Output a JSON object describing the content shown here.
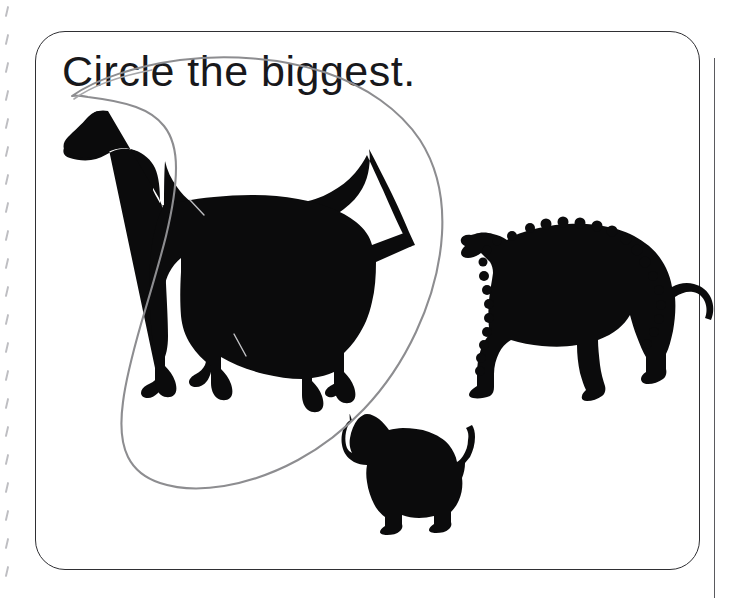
{
  "page": {
    "width": 731,
    "height": 598,
    "background_color": "#ffffff",
    "kind": "printed worksheet page photo",
    "binding_edge": {
      "name": "spiral-binding-perforation-marks",
      "tick_count": 21,
      "tick_spacing_px": 28,
      "tick_color": "#b9b9bd",
      "side": "left"
    },
    "right_page_edge": {
      "name": "page-edge-rule",
      "color": "#5a5a5e",
      "x": 714
    }
  },
  "card": {
    "border_color": "#2f2f33",
    "border_radius_px": 30,
    "fill": "#ffffff"
  },
  "prompt": {
    "text": "Circle the biggest.",
    "color": "#18181b",
    "font_size_px": 43
  },
  "answer_mark": {
    "name": "hand-drawn-pencil-circle",
    "color": "#8d8d90",
    "stroke_width": 2,
    "encircles": "great-dane-silhouette",
    "description": "wobbly gray pencil oval looped around the largest dog"
  },
  "figures": [
    {
      "id": "dog-large",
      "label": "Great Dane",
      "size_rank": "biggest",
      "is_answer": true,
      "fill": "#0b0b0c",
      "facing": "left",
      "bbox": {
        "x": 62,
        "y": 108,
        "width": 360,
        "height": 290
      }
    },
    {
      "id": "dog-medium",
      "label": "shaggy medium dog",
      "size_rank": "medium",
      "is_answer": false,
      "fill": "#0b0b0c",
      "facing": "left",
      "bbox": {
        "x": 458,
        "y": 205,
        "width": 220,
        "height": 190
      }
    },
    {
      "id": "dog-small",
      "label": "Chihuahua",
      "size_rank": "smallest",
      "is_answer": false,
      "fill": "#0b0b0c",
      "facing": "left",
      "bbox": {
        "x": 338,
        "y": 415,
        "width": 120,
        "height": 120
      }
    }
  ],
  "chart_data": {
    "type": "bar",
    "categories": [
      "Great Dane",
      "Shaggy medium dog",
      "Chihuahua"
    ],
    "values": [
      290,
      190,
      120
    ],
    "xlabel": "Dog",
    "ylabel": "Silhouette height (px)",
    "ylim": [
      0,
      300
    ],
    "grid": false,
    "legend": "none"
  }
}
